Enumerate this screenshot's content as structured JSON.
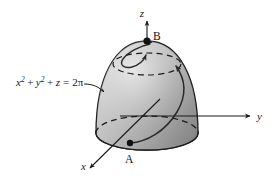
{
  "figure": {
    "name": "paraboloid-surface-diagram",
    "background_color": "#ffffff",
    "surface_color_light": "#d8d8d8",
    "surface_color_mid": "#b6b6b6",
    "surface_color_dark": "#8e8e8e",
    "base_color": "#a9a9a9",
    "line_color": "#1a1a1a"
  },
  "axes": {
    "z": {
      "label": "z",
      "direction": "up"
    },
    "y": {
      "label": "y",
      "direction": "right"
    },
    "x": {
      "label": "x",
      "direction": "down-left"
    }
  },
  "points": [
    {
      "id": "A",
      "label": "A",
      "location": "front-lower-left of base ellipse"
    },
    {
      "id": "B",
      "label": "B",
      "location": "apex on z-axis"
    }
  ],
  "equation": {
    "full": "x² + y² + z = 2π",
    "term1_var": "x",
    "term1_sup": "2",
    "plus1": "+",
    "term2_var": "y",
    "term2_sup": "2",
    "plus2": "+",
    "term3_var": "z",
    "equals": "=",
    "rhs": "2π"
  },
  "curve": {
    "name": "spiral-path",
    "from": "A",
    "to": "B",
    "arrowheads": 2
  }
}
